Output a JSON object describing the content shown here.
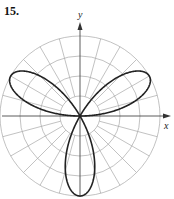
{
  "problem": {
    "number": "15."
  },
  "chart_data": {
    "type": "line",
    "subtype": "polar",
    "title": "15.",
    "xlabel": "x",
    "ylabel": "y",
    "curve": "three-petaled rose (r = sin 3θ)",
    "petals": [
      {
        "direction_deg": 30,
        "length": 1
      },
      {
        "direction_deg": 150,
        "length": 1
      },
      {
        "direction_deg": 270,
        "length": 1
      }
    ],
    "grid": {
      "rings": 4,
      "radial_spacing_deg": 15,
      "max_r": 1
    },
    "colors": {
      "curve": "#222222",
      "grid": "#a8a8a8",
      "axes": "#333333"
    }
  }
}
